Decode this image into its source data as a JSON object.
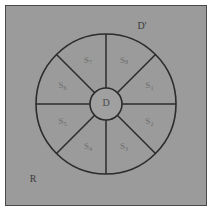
{
  "figure": {
    "caption_labels": {
      "outer_region": "R",
      "outer_disk": "D'",
      "inner_disk": "D"
    },
    "colors": {
      "background": "#ffffff",
      "region_fill": "#9b9b9b",
      "disk_fill": "#a0a0a0",
      "stroke": "#2b2b2b",
      "frame_border": "#4a4a4a",
      "sector_label": "#6d6d6d",
      "outer_label": "#3a3a3a"
    },
    "geometry": {
      "center_x": 106,
      "center_y": 104,
      "outer_radius": 70,
      "inner_radius": 16,
      "sector_count": 8,
      "spoke_angles_deg": [
        0,
        45,
        90,
        135,
        180,
        225,
        270,
        315
      ]
    },
    "sectors": [
      {
        "name": "S",
        "subscript": "1",
        "angle_deg": 67.5,
        "label_radius": 47
      },
      {
        "name": "S",
        "subscript": "2",
        "angle_deg": 112.5,
        "label_radius": 47
      },
      {
        "name": "S",
        "subscript": "3",
        "angle_deg": 157.5,
        "label_radius": 47
      },
      {
        "name": "S",
        "subscript": "4",
        "angle_deg": 202.5,
        "label_radius": 47
      },
      {
        "name": "S",
        "subscript": "5",
        "angle_deg": 247.5,
        "label_radius": 47
      },
      {
        "name": "S",
        "subscript": "6",
        "angle_deg": 292.5,
        "label_radius": 47
      },
      {
        "name": "S",
        "subscript": "7",
        "angle_deg": 337.5,
        "label_radius": 47
      },
      {
        "name": "S",
        "subscript": "8",
        "angle_deg": 22.5,
        "label_radius": 47
      }
    ],
    "annotations": {
      "outer_disk_label_x": 142,
      "outer_disk_label_y": 27,
      "inner_disk_label_x": 106,
      "inner_disk_label_y": 104,
      "region_label_x": 33,
      "region_label_y": 180
    }
  }
}
